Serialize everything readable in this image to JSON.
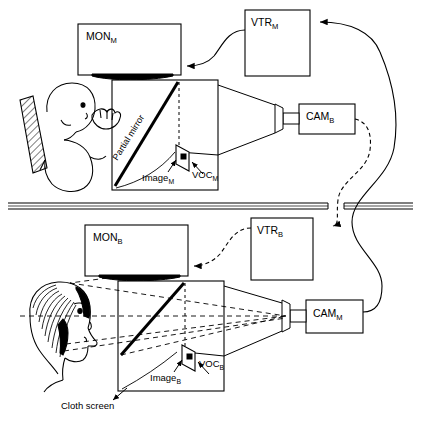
{
  "figure": {
    "type": "schematic-diagram",
    "width": 421,
    "height": 425,
    "line_color": "#000000",
    "background": "#ffffff"
  },
  "rooms": {
    "top": {
      "name": "infant-room",
      "occupant": "infant-in-reclined-seat"
    },
    "bottom": {
      "name": "mother-room",
      "occupant": "mother-head-profile"
    },
    "divider": {
      "name": "partition-wall",
      "description": "horizontal double-line wall with cable gap"
    }
  },
  "equipment": {
    "mon_m": {
      "label": "MON",
      "sub": "M",
      "name": "monitor-m"
    },
    "mon_b": {
      "label": "MON",
      "sub": "B",
      "name": "monitor-b"
    },
    "vtr_m": {
      "label": "VTR",
      "sub": "M",
      "name": "vtr-m"
    },
    "vtr_b": {
      "label": "VTR",
      "sub": "B",
      "name": "vtr-b"
    },
    "cam_b": {
      "label": "CAM",
      "sub": "B",
      "name": "camera-b"
    },
    "cam_m": {
      "label": "CAM",
      "sub": "M",
      "name": "camera-m"
    }
  },
  "optics": {
    "partial_mirror": {
      "label": "Partial mirror"
    },
    "image_m": {
      "label": "Image",
      "sub": "M"
    },
    "image_b": {
      "label": "Image",
      "sub": "B"
    },
    "voc_m": {
      "label": "VOC",
      "sub": "M"
    },
    "voc_b": {
      "label": "VOC",
      "sub": "B"
    },
    "cloth_screen": {
      "label": "Cloth screen"
    }
  },
  "cables": [
    {
      "name": "cam-m-to-vtr-m",
      "style": "solid",
      "from": "CAM_M",
      "to": "VTR_M"
    },
    {
      "name": "vtr-m-to-mon-m",
      "style": "solid",
      "from": "VTR_M",
      "to": "MON_M"
    },
    {
      "name": "cam-b-to-vtr-b",
      "style": "dashed",
      "from": "CAM_B",
      "to": "VTR_B"
    },
    {
      "name": "vtr-b-to-mon-b",
      "style": "dashed",
      "from": "VTR_B",
      "to": "MON_B"
    }
  ]
}
